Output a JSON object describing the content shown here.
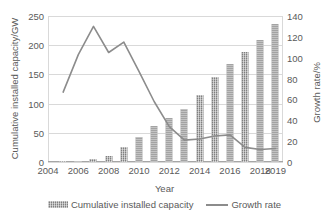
{
  "chart_data": {
    "type": "bar",
    "title": "",
    "xlabel": "Year",
    "ylabel": "Cumulative installed capacity/GW",
    "y2label": "Growth rate/%",
    "grid": true,
    "legend_position": "bottom",
    "xlim": [
      2004,
      2019.5
    ],
    "ylim": [
      0,
      250
    ],
    "y2lim": [
      0,
      140
    ],
    "yticks": [
      0,
      50,
      100,
      150,
      200,
      250
    ],
    "y2ticks": [
      0,
      20,
      40,
      60,
      80,
      100,
      120,
      140
    ],
    "xticks": [
      2004,
      2006,
      2008,
      2010,
      2012,
      2014,
      2016,
      2018,
      2019
    ],
    "xtick_labels": [
      "2004",
      "2006",
      "2008",
      "2010",
      "2012",
      "2014",
      "2016",
      "2018",
      "2019"
    ],
    "x": [
      2005,
      2006,
      2007,
      2008,
      2009,
      2010,
      2011,
      2012,
      2013,
      2014,
      2015,
      2016,
      2017,
      2018,
      2019
    ],
    "series": [
      {
        "name": "Cumulative installed capacity",
        "axis": "left",
        "type": "bar",
        "unit": "GW",
        "values": [
          1.4,
          2.2,
          4.6,
          10.1,
          25.0,
          43.5,
          62.0,
          76.0,
          91.0,
          114.0,
          145.0,
          168.0,
          188.0,
          209.0,
          237.0
        ]
      },
      {
        "name": "Growth rate",
        "axis": "right",
        "type": "line",
        "unit": "%",
        "values": [
          67.0,
          103.0,
          130.0,
          105.0,
          115.0,
          87.0,
          58.0,
          34.0,
          21.0,
          22.0,
          25.0,
          26.0,
          14.0,
          12.0,
          13.0
        ]
      }
    ]
  },
  "legend": {
    "items": [
      {
        "label": "Cumulative installed capacity",
        "marker": "hatched-bar-swatch"
      },
      {
        "label": "Growth rate",
        "marker": "line-swatch"
      }
    ]
  },
  "colors": {
    "bar": "#808080",
    "line": "#8c8c8c",
    "grid": "#d9d9d9",
    "axis": "#a6a6a6",
    "text": "#5a5a5a",
    "background": "#ffffff"
  }
}
